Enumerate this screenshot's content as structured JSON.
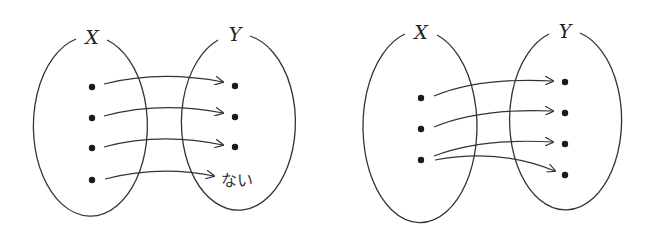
{
  "diagrams": [
    {
      "name": "mapping-not-defined",
      "domain_label": "X",
      "codomain_label": "Y",
      "domain_points": 4,
      "codomain_points": 3,
      "undefined_target_label": "ない",
      "arrows": [
        {
          "from": 1,
          "to": 1
        },
        {
          "from": 2,
          "to": 2
        },
        {
          "from": 3,
          "to": 3
        },
        {
          "from": 4,
          "to": "ない"
        }
      ]
    },
    {
      "name": "mapping-multivalued",
      "domain_label": "X",
      "codomain_label": "Y",
      "domain_points": 3,
      "codomain_points": 4,
      "arrows": [
        {
          "from": 1,
          "to": 1
        },
        {
          "from": 2,
          "to": 2
        },
        {
          "from": 3,
          "to": 3
        },
        {
          "from": 3,
          "to": 4
        }
      ]
    }
  ],
  "colors": {
    "stroke": "#333333",
    "dot": "#1a1a1a",
    "background": "#ffffff"
  }
}
